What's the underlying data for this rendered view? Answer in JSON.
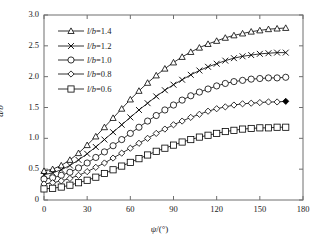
{
  "chart_data": {
    "type": "line",
    "title": "",
    "subtitle": "",
    "xlabel": "ψ/(°)",
    "xlabel_italic_part": "ψ",
    "ylabel": "d/b",
    "xlim": [
      0,
      180
    ],
    "ylim": [
      0,
      3.0
    ],
    "xticks": [
      0,
      30,
      60,
      90,
      120,
      150,
      180
    ],
    "xticklabels": [
      "0",
      "30",
      "60",
      "90",
      "120",
      "150",
      "180"
    ],
    "yticks": [
      0,
      0.5,
      1.0,
      1.5,
      2.0,
      2.5,
      3.0
    ],
    "yticklabels": [
      "0",
      "0.5",
      "1.0",
      "1.5",
      "2.0",
      "2.5",
      "3.0"
    ],
    "grid": false,
    "legend_position": "upper-left-inside",
    "x": [
      0,
      6,
      12,
      18,
      24,
      30,
      36,
      42,
      48,
      54,
      60,
      66,
      72,
      78,
      84,
      90,
      96,
      102,
      108,
      114,
      120,
      126,
      132,
      138,
      144,
      150,
      156,
      162,
      168
    ],
    "series": [
      {
        "name": "l/b=1.4",
        "marker": "triangle-up",
        "label_prefix_italic": "l/b",
        "label_value": "1.4",
        "values": [
          0.47,
          0.5,
          0.56,
          0.65,
          0.76,
          0.89,
          1.03,
          1.18,
          1.33,
          1.48,
          1.63,
          1.77,
          1.9,
          2.02,
          2.13,
          2.23,
          2.32,
          2.4,
          2.47,
          2.53,
          2.58,
          2.63,
          2.67,
          2.7,
          2.73,
          2.75,
          2.77,
          2.78,
          2.79
        ]
      },
      {
        "name": "l/b=1.2",
        "marker": "cross",
        "label_prefix_italic": "l/b",
        "label_value": "1.2",
        "values": [
          0.41,
          0.44,
          0.49,
          0.56,
          0.65,
          0.75,
          0.86,
          0.98,
          1.1,
          1.22,
          1.34,
          1.46,
          1.57,
          1.68,
          1.78,
          1.87,
          1.95,
          2.03,
          2.1,
          2.16,
          2.21,
          2.26,
          2.3,
          2.33,
          2.35,
          2.37,
          2.38,
          2.39,
          2.39
        ]
      },
      {
        "name": "l/b=1.0",
        "marker": "circle",
        "label_prefix_italic": "l/b",
        "label_value": "1.0",
        "values": [
          0.34,
          0.36,
          0.4,
          0.45,
          0.52,
          0.6,
          0.69,
          0.78,
          0.88,
          0.98,
          1.08,
          1.18,
          1.28,
          1.37,
          1.46,
          1.54,
          1.62,
          1.69,
          1.75,
          1.8,
          1.85,
          1.89,
          1.92,
          1.94,
          1.96,
          1.97,
          1.98,
          1.98,
          1.99
        ]
      },
      {
        "name": "l/b=0.8",
        "marker": "diamond",
        "label_prefix_italic": "l/b",
        "label_value": "0.8",
        "values": [
          0.26,
          0.28,
          0.31,
          0.35,
          0.4,
          0.46,
          0.53,
          0.6,
          0.68,
          0.76,
          0.84,
          0.92,
          1.0,
          1.08,
          1.15,
          1.22,
          1.28,
          1.34,
          1.39,
          1.44,
          1.48,
          1.51,
          1.54,
          1.56,
          1.57,
          1.58,
          1.59,
          1.59,
          1.6
        ]
      },
      {
        "name": "l/b=0.6",
        "marker": "square",
        "label_prefix_italic": "l/b",
        "label_value": "0.6",
        "values": [
          0.18,
          0.19,
          0.21,
          0.24,
          0.28,
          0.32,
          0.37,
          0.43,
          0.49,
          0.55,
          0.61,
          0.67,
          0.73,
          0.79,
          0.84,
          0.89,
          0.94,
          0.98,
          1.02,
          1.05,
          1.08,
          1.11,
          1.13,
          1.15,
          1.16,
          1.17,
          1.17,
          1.18,
          1.18
        ]
      }
    ],
    "end_markers_filled": [
      "diamond"
    ],
    "colors": {
      "line": "#000000",
      "axis": "#6e6e6e",
      "text": "#1a1a1a",
      "background": "#ffffff"
    }
  }
}
